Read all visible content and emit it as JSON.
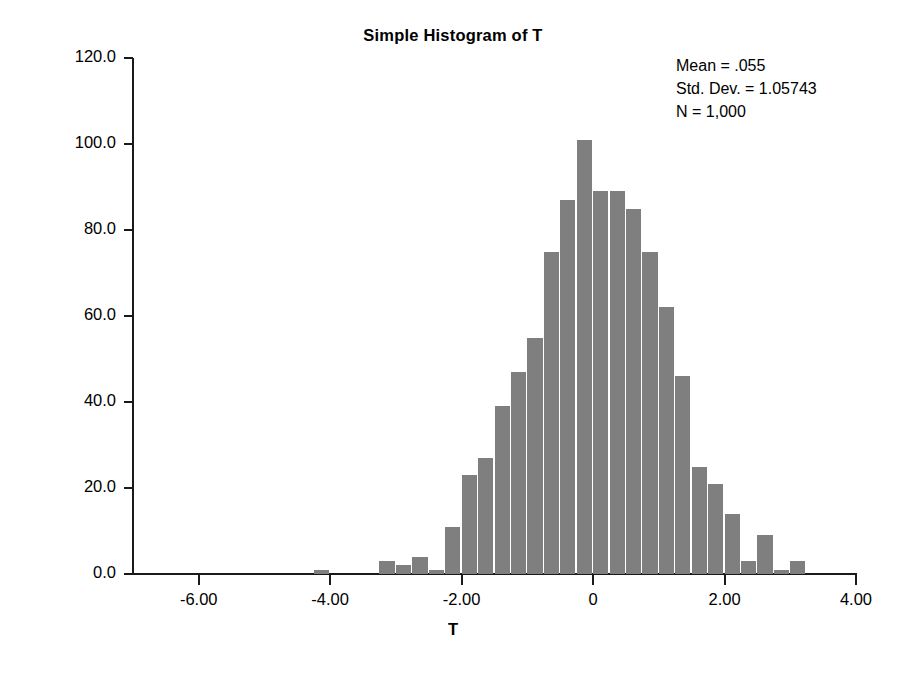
{
  "chart_data": {
    "type": "bar",
    "title": "Simple Histogram of T",
    "xlabel": "T",
    "ylabel": "Frequency",
    "xlim": [
      -7.0,
      4.0
    ],
    "ylim": [
      0.0,
      120.0
    ],
    "grid": false,
    "bin_width": 0.25,
    "xticks": [
      -6.0,
      -4.0,
      -2.0,
      0,
      2.0,
      4.0
    ],
    "xticklabels": [
      "-6.00",
      "-4.00",
      "-2.00",
      "0",
      "2.00",
      "4.00"
    ],
    "yticks": [
      0.0,
      20.0,
      40.0,
      60.0,
      80.0,
      100.0,
      120.0
    ],
    "yticklabels": [
      "0.0",
      "20.0",
      "40.0",
      "60.0",
      "80.0",
      "100.0",
      "120.0"
    ],
    "bin_centers": [
      -4.125,
      -3.125,
      -2.875,
      -2.625,
      -2.375,
      -2.125,
      -1.875,
      -1.625,
      -1.375,
      -1.125,
      -0.875,
      -0.625,
      -0.375,
      -0.125,
      0.125,
      0.375,
      0.625,
      0.875,
      1.125,
      1.375,
      1.625,
      1.875,
      2.125,
      2.375,
      2.625,
      2.875,
      3.125
    ],
    "values": [
      1,
      3,
      2,
      4,
      1,
      11,
      23,
      27,
      39,
      47,
      55,
      75,
      87,
      101,
      89,
      89,
      85,
      75,
      62,
      46,
      25,
      21,
      14,
      3,
      9,
      1,
      3
    ],
    "annotations": [
      "Mean = .055",
      "Std. Dev. = 1.05743",
      "N = 1,000"
    ],
    "bar_color": "#7f7f7f",
    "axis_color": "#1a1a1a",
    "background": "#ffffff"
  }
}
